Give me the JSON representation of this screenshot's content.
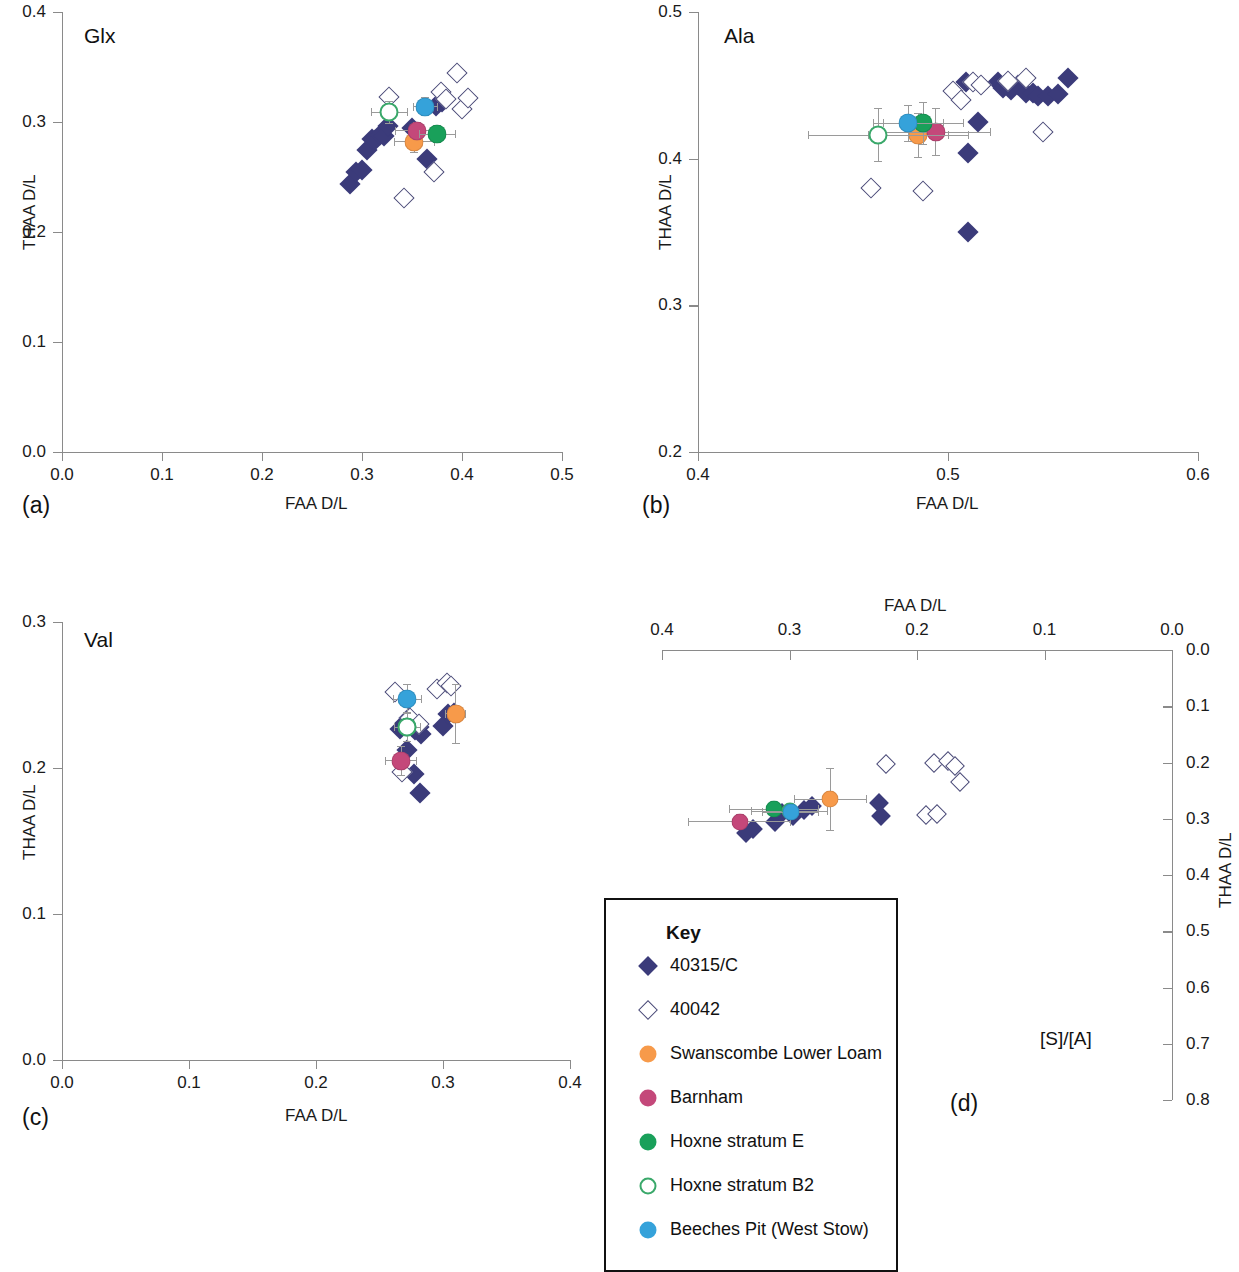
{
  "figure": {
    "panels": [
      {
        "tag": "(a)",
        "title": "Glx",
        "xlabel": "FAA D/L",
        "ylabel": "THAA D/L",
        "xticks": [
          "0.0",
          "0.1",
          "0.2",
          "0.3",
          "0.4",
          "0.5"
        ],
        "yticks": [
          "0.0",
          "0.1",
          "0.2",
          "0.3",
          "0.4"
        ],
        "xlim": [
          0.0,
          0.5
        ],
        "ylim": [
          0.0,
          0.4
        ]
      },
      {
        "tag": "(b)",
        "title": "Ala",
        "xlabel": "FAA D/L",
        "ylabel": "THAA D/L",
        "xticks": [
          "0.4",
          "0.5",
          "0.6"
        ],
        "yticks": [
          "0.2",
          "0.3",
          "0.4",
          "0.5"
        ],
        "xlim": [
          0.4,
          0.6
        ],
        "ylim": [
          0.2,
          0.5
        ]
      },
      {
        "tag": "(c)",
        "title": "Val",
        "xlabel": "FAA D/L",
        "ylabel": "THAA D/L",
        "xticks": [
          "0.0",
          "0.1",
          "0.2",
          "0.3",
          "0.4"
        ],
        "yticks": [
          "0.0",
          "0.1",
          "0.2",
          "0.3"
        ],
        "xlim": [
          0.0,
          0.4
        ],
        "ylim": [
          0.0,
          0.3
        ]
      },
      {
        "tag": "(d)",
        "title": "[S]/[A]",
        "xlabel": "FAA D/L",
        "ylabel": "THAA D/L",
        "xticks": [
          "0.4",
          "0.3",
          "0.2",
          "0.1",
          "0.0"
        ],
        "yticks": [
          "0.0",
          "0.1",
          "0.2",
          "0.3",
          "0.4",
          "0.5",
          "0.6",
          "0.7",
          "0.8"
        ],
        "xlim": [
          0.4,
          0.0
        ],
        "ylim": [
          0.0,
          0.8
        ]
      }
    ],
    "legend": {
      "title": "Key",
      "items": [
        {
          "label": "40315/C",
          "marker": "filled-diamond",
          "color": "#3b3b7a"
        },
        {
          "label": "40042",
          "marker": "open-diamond",
          "color": "#4a4a78"
        },
        {
          "label": "Swanscombe Lower Loam",
          "marker": "filled-circle",
          "color": "#f79a4a"
        },
        {
          "label": "Barnham",
          "marker": "filled-circle",
          "color": "#c4487a"
        },
        {
          "label": "Hoxne stratum E",
          "marker": "filled-circle",
          "color": "#19a05a"
        },
        {
          "label": "Hoxne stratum B2",
          "marker": "open-circle",
          "color": "#3aa86a"
        },
        {
          "label": "Beeches Pit (West Stow)",
          "marker": "filled-circle",
          "color": "#35a2da"
        }
      ]
    }
  },
  "chart_data": [
    {
      "type": "scatter",
      "panel": "(a)",
      "title": "Glx",
      "xlabel": "FAA D/L",
      "ylabel": "THAA D/L",
      "xlim": [
        0.0,
        0.5
      ],
      "ylim": [
        0.0,
        0.4
      ],
      "grid": false,
      "series": [
        {
          "name": "40315/C",
          "marker": "filled-diamond",
          "color": "#3b3b7a",
          "points": [
            [
              0.288,
              0.244
            ],
            [
              0.294,
              0.255
            ],
            [
              0.3,
              0.256
            ],
            [
              0.305,
              0.275
            ],
            [
              0.31,
              0.285
            ],
            [
              0.313,
              0.284
            ],
            [
              0.318,
              0.288
            ],
            [
              0.322,
              0.287
            ],
            [
              0.326,
              0.296
            ],
            [
              0.35,
              0.295
            ],
            [
              0.365,
              0.266
            ],
            [
              0.374,
              0.315
            ],
            [
              0.38,
              0.318
            ]
          ]
        },
        {
          "name": "40042",
          "marker": "open-diamond",
          "color": "#4a4a78",
          "points": [
            [
              0.327,
              0.323
            ],
            [
              0.342,
              0.231
            ],
            [
              0.372,
              0.255
            ],
            [
              0.379,
              0.327
            ],
            [
              0.384,
              0.321
            ],
            [
              0.395,
              0.345
            ],
            [
              0.4,
              0.312
            ],
            [
              0.406,
              0.322
            ]
          ]
        },
        {
          "name": "Swanscombe Lower Loam",
          "marker": "filled-circle",
          "color": "#f79a4a",
          "points": [
            [
              0.352,
              0.282
            ]
          ],
          "xerr": 0.02,
          "yerr": 0.01
        },
        {
          "name": "Barnham",
          "marker": "filled-circle",
          "color": "#c4487a",
          "points": [
            [
              0.355,
              0.292
            ]
          ],
          "xerr": 0.022,
          "yerr": 0.008
        },
        {
          "name": "Hoxne stratum E",
          "marker": "filled-circle",
          "color": "#19a05a",
          "points": [
            [
              0.375,
              0.289
            ]
          ],
          "xerr": 0.018,
          "yerr": 0.008
        },
        {
          "name": "Hoxne stratum B2",
          "marker": "open-circle",
          "color": "#3aa86a",
          "points": [
            [
              0.327,
              0.309
            ]
          ],
          "xerr": 0.018,
          "yerr": 0.01
        },
        {
          "name": "Beeches Pit (West Stow)",
          "marker": "filled-circle",
          "color": "#35a2da",
          "points": [
            [
              0.363,
              0.314
            ]
          ],
          "xerr": 0.012,
          "yerr": 0.008
        }
      ]
    },
    {
      "type": "scatter",
      "panel": "(b)",
      "title": "Ala",
      "xlabel": "FAA D/L",
      "ylabel": "THAA D/L",
      "xlim": [
        0.4,
        0.6
      ],
      "ylim": [
        0.2,
        0.5
      ],
      "grid": false,
      "series": [
        {
          "name": "40315/C",
          "marker": "filled-diamond",
          "color": "#3b3b7a",
          "points": [
            [
              0.507,
              0.452
            ],
            [
              0.52,
              0.452
            ],
            [
              0.522,
              0.448
            ],
            [
              0.525,
              0.447
            ],
            [
              0.528,
              0.45
            ],
            [
              0.531,
              0.445
            ],
            [
              0.534,
              0.445
            ],
            [
              0.536,
              0.443
            ],
            [
              0.54,
              0.443
            ],
            [
              0.544,
              0.444
            ],
            [
              0.548,
              0.455
            ],
            [
              0.512,
              0.425
            ],
            [
              0.508,
              0.404
            ],
            [
              0.508,
              0.35
            ]
          ]
        },
        {
          "name": "40042",
          "marker": "open-diamond",
          "color": "#4a4a78",
          "points": [
            [
              0.502,
              0.446
            ],
            [
              0.505,
              0.44
            ],
            [
              0.51,
              0.452
            ],
            [
              0.513,
              0.45
            ],
            [
              0.524,
              0.453
            ],
            [
              0.531,
              0.455
            ],
            [
              0.538,
              0.418
            ],
            [
              0.469,
              0.38
            ],
            [
              0.49,
              0.378
            ]
          ]
        },
        {
          "name": "Swanscombe Lower Loam",
          "marker": "filled-circle",
          "color": "#f79a4a",
          "points": [
            [
              0.488,
              0.416
            ]
          ],
          "xerr": 0.02,
          "yerr": 0.015
        },
        {
          "name": "Barnham",
          "marker": "filled-circle",
          "color": "#c4487a",
          "points": [
            [
              0.495,
              0.418
            ]
          ],
          "xerr": 0.022,
          "yerr": 0.016
        },
        {
          "name": "Hoxne stratum E",
          "marker": "filled-circle",
          "color": "#19a05a",
          "points": [
            [
              0.49,
              0.424
            ]
          ],
          "xerr": 0.016,
          "yerr": 0.014
        },
        {
          "name": "Hoxne stratum B2",
          "marker": "open-circle",
          "color": "#3aa86a",
          "points": [
            [
              0.472,
              0.416
            ]
          ],
          "xerr": 0.028,
          "yerr": 0.018
        },
        {
          "name": "Beeches Pit (West Stow)",
          "marker": "filled-circle",
          "color": "#35a2da",
          "points": [
            [
              0.484,
              0.424
            ]
          ],
          "xerr": 0.014,
          "yerr": 0.012
        }
      ]
    },
    {
      "type": "scatter",
      "panel": "(c)",
      "title": "Val",
      "xlabel": "FAA D/L",
      "ylabel": "THAA D/L",
      "xlim": [
        0.0,
        0.4
      ],
      "ylim": [
        0.0,
        0.3
      ],
      "grid": false,
      "series": [
        {
          "name": "40315/C",
          "marker": "filled-diamond",
          "color": "#3b3b7a",
          "points": [
            [
              0.266,
              0.227
            ],
            [
              0.27,
              0.231
            ],
            [
              0.273,
              0.234
            ],
            [
              0.276,
              0.23
            ],
            [
              0.278,
              0.226
            ],
            [
              0.281,
              0.228
            ],
            [
              0.283,
              0.223
            ],
            [
              0.272,
              0.212
            ],
            [
              0.277,
              0.196
            ],
            [
              0.282,
              0.183
            ],
            [
              0.3,
              0.229
            ],
            [
              0.304,
              0.237
            ],
            [
              0.309,
              0.238
            ]
          ]
        },
        {
          "name": "40042",
          "marker": "open-diamond",
          "color": "#4a4a78",
          "points": [
            [
              0.262,
              0.252
            ],
            [
              0.274,
              0.234
            ],
            [
              0.281,
              0.23
            ],
            [
              0.268,
              0.197
            ],
            [
              0.295,
              0.254
            ],
            [
              0.303,
              0.258
            ],
            [
              0.306,
              0.256
            ]
          ]
        },
        {
          "name": "Swanscombe Lower Loam",
          "marker": "filled-circle",
          "color": "#f79a4a",
          "points": [
            [
              0.31,
              0.237
            ]
          ],
          "xerr": 0.008,
          "yerr": 0.02
        },
        {
          "name": "Barnham",
          "marker": "filled-circle",
          "color": "#c4487a",
          "points": [
            [
              0.267,
              0.205
            ]
          ],
          "xerr": 0.012,
          "yerr": 0.01
        },
        {
          "name": "Hoxne stratum E",
          "marker": "filled-circle",
          "color": "#19a05a",
          "points": [
            [
              0.272,
              0.228
            ]
          ],
          "xerr": 0.01,
          "yerr": 0.01
        },
        {
          "name": "Hoxne stratum B2",
          "marker": "open-circle",
          "color": "#3aa86a",
          "points": [
            [
              0.272,
              0.228
            ]
          ],
          "xerr": 0.01,
          "yerr": 0.01
        },
        {
          "name": "Beeches Pit (West Stow)",
          "marker": "filled-circle",
          "color": "#35a2da",
          "points": [
            [
              0.272,
              0.247
            ]
          ],
          "xerr": 0.011,
          "yerr": 0.01
        }
      ]
    },
    {
      "type": "scatter",
      "panel": "(d)",
      "title": "[S]/[A]",
      "xlabel": "FAA D/L",
      "ylabel": "THAA D/L",
      "xlim": [
        0.4,
        0.0
      ],
      "ylim": [
        0.0,
        0.8
      ],
      "grid": false,
      "series": [
        {
          "name": "40315/C",
          "marker": "filled-diamond",
          "color": "#3b3b7a",
          "points": [
            [
              0.334,
              0.325
            ],
            [
              0.329,
              0.318
            ],
            [
              0.311,
              0.305
            ],
            [
              0.306,
              0.29
            ],
            [
              0.297,
              0.295
            ],
            [
              0.289,
              0.285
            ],
            [
              0.282,
              0.278
            ],
            [
              0.23,
              0.272
            ],
            [
              0.228,
              0.295
            ]
          ]
        },
        {
          "name": "40042",
          "marker": "open-diamond",
          "color": "#4a4a78",
          "points": [
            [
              0.224,
              0.203
            ],
            [
              0.187,
              0.2
            ],
            [
              0.176,
              0.197
            ],
            [
              0.17,
              0.207
            ],
            [
              0.166,
              0.235
            ],
            [
              0.193,
              0.293
            ],
            [
              0.184,
              0.292
            ]
          ]
        },
        {
          "name": "Swanscombe Lower Loam",
          "marker": "filled-circle",
          "color": "#f79a4a",
          "points": [
            [
              0.268,
              0.265
            ]
          ],
          "xerr": 0.028,
          "yerr": 0.055
        },
        {
          "name": "Barnham",
          "marker": "filled-circle",
          "color": "#c4487a",
          "points": [
            [
              0.339,
              0.305
            ]
          ],
          "xerr": 0.04,
          "yerr": 0.012
        },
        {
          "name": "Hoxne stratum E",
          "marker": "filled-circle",
          "color": "#19a05a",
          "points": [
            [
              0.312,
              0.283
            ]
          ],
          "xerr": 0.035,
          "yerr": 0.012
        },
        {
          "name": "Hoxne stratum B2",
          "marker": "open-circle",
          "color": "#3aa86a",
          "points": [
            [
              0.3,
              0.287
            ]
          ],
          "xerr": 0.03,
          "yerr": 0.012
        },
        {
          "name": "Beeches Pit (West Stow)",
          "marker": "filled-circle",
          "color": "#35a2da",
          "points": [
            [
              0.299,
              0.288
            ]
          ],
          "xerr": 0.022,
          "yerr": 0.012
        }
      ]
    }
  ]
}
